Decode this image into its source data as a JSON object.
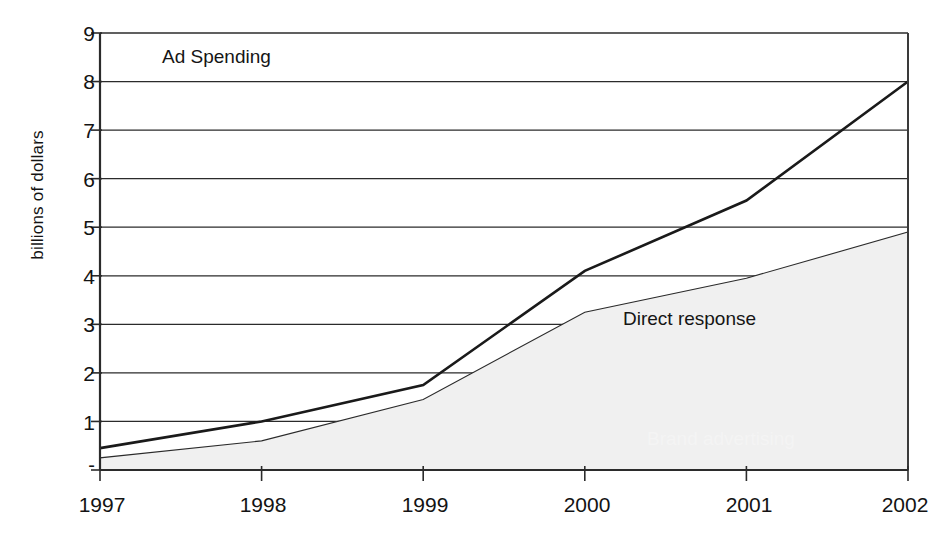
{
  "chart_data": {
    "type": "area",
    "title": "Ad Spending",
    "subtitle": "",
    "xlabel": "",
    "ylabel": "billions of dollars",
    "stacked": true,
    "grid": true,
    "legend_position": "in-plot-annotations",
    "x": [
      "1997",
      "1998",
      "1999",
      "2000",
      "2001",
      "2002"
    ],
    "categories": [
      "1997",
      "1998",
      "1999",
      "2000",
      "2001",
      "2002"
    ],
    "xlim": [
      "1997",
      "2002"
    ],
    "ylim": [
      0,
      9
    ],
    "y_ticks": [
      "-",
      "1",
      "2",
      "3",
      "4",
      "5",
      "6",
      "7",
      "8",
      "9"
    ],
    "y_tick_values": [
      0,
      1,
      2,
      3,
      4,
      5,
      6,
      7,
      8,
      9
    ],
    "x_ticks": [
      "1997",
      "1998",
      "1999",
      "2000",
      "2001",
      "2002"
    ],
    "series": [
      {
        "name": "Brand advertising",
        "color": "#111111",
        "values": [
          0.2,
          0.4,
          0.3,
          0.85,
          1.6,
          3.1
        ]
      },
      {
        "name": "Direct response",
        "color": "#f0f0f0",
        "values": [
          0.25,
          0.6,
          1.45,
          3.25,
          3.95,
          4.9
        ]
      }
    ],
    "totals": [
      0.45,
      1.0,
      1.75,
      4.1,
      5.55,
      8.0
    ],
    "annotations": [
      {
        "text": "Ad Spending",
        "name": "plot-title"
      },
      {
        "text": "Direct response",
        "name": "series-label-direct-response"
      },
      {
        "text": "Brand advertising",
        "name": "series-label-brand-advertising"
      }
    ]
  },
  "axis": {
    "y_title": "billions of dollars"
  }
}
